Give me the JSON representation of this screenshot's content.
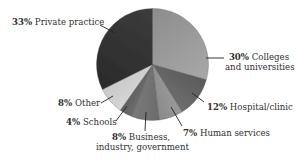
{
  "chart_data": {
    "type": "pie",
    "title": "",
    "categories": [
      "Colleges and universities",
      "Hospital/clinic",
      "Human services",
      "Business, industry, government",
      "Schools",
      "Other",
      "Private practice"
    ],
    "values": [
      30,
      12,
      7,
      8,
      4,
      8,
      33
    ],
    "unit": "%",
    "start_angle": "12 o'clock, clockwise",
    "legend": "none (direct labels with leader lines)",
    "slices": [
      {
        "label": "Colleges and universities",
        "value": 30,
        "color": "#a8a8a8",
        "color_edge": "#8c8c8c"
      },
      {
        "label": "Hospital/clinic",
        "value": 12,
        "color": "#6e6e6e",
        "color_edge": "#5a5a5a"
      },
      {
        "label": "Human services",
        "value": 7,
        "color": "#8a8a8a",
        "color_edge": "#9a9a9a"
      },
      {
        "label": "Business, industry, government",
        "value": 8,
        "color": "#7a7a7a",
        "color_edge": "#6a6a6a"
      },
      {
        "label": "Schools",
        "value": 4,
        "color": "#5e5e5e",
        "color_edge": "#6e6e6e"
      },
      {
        "label": "Other",
        "value": 8,
        "color": "#c8c8c8",
        "color_edge": "#d6d6d6"
      },
      {
        "label": "Private practice",
        "value": 33,
        "color": "#3c3c3c",
        "color_edge": "#2a2a2a"
      }
    ]
  },
  "labels": {
    "private": {
      "pct": "33%",
      "text": "Private practice"
    },
    "colleges": {
      "pct": "30%",
      "text1": "Colleges",
      "text2": "and universities"
    },
    "hospital": {
      "pct": "12%",
      "text": "Hospital/clinic"
    },
    "human": {
      "pct": "7%",
      "text": "Human services"
    },
    "business": {
      "pct": "8%",
      "text1": "Business,",
      "text2": "industry, government"
    },
    "schools": {
      "pct": "4%",
      "text": "Schools"
    },
    "other": {
      "pct": "8%",
      "text": "Other"
    }
  }
}
